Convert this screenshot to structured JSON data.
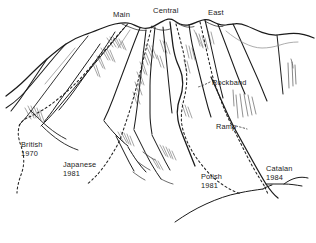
{
  "figure": {
    "kind": "line-drawing",
    "colors": {
      "background": "#ffffff",
      "ink": "#1b1b1b",
      "ink_light": "#7a7a7a",
      "ink_mid": "#4a4a4a",
      "text": "#1b1b1b"
    }
  },
  "summits": [
    {
      "id": "main",
      "label": "Main"
    },
    {
      "id": "central",
      "label": "Central"
    },
    {
      "id": "east",
      "label": "East"
    }
  ],
  "features": [
    {
      "id": "rockband",
      "label": "Rockband"
    },
    {
      "id": "ramp",
      "label": "Ramp"
    }
  ],
  "routes": [
    {
      "id": "british",
      "name": "British",
      "year": "1970"
    },
    {
      "id": "japanese",
      "name": "Japanese",
      "year": "1981"
    },
    {
      "id": "polish",
      "name": "Polish",
      "year": "1981"
    },
    {
      "id": "catalan",
      "name": "Catalan",
      "year": "1984"
    }
  ]
}
